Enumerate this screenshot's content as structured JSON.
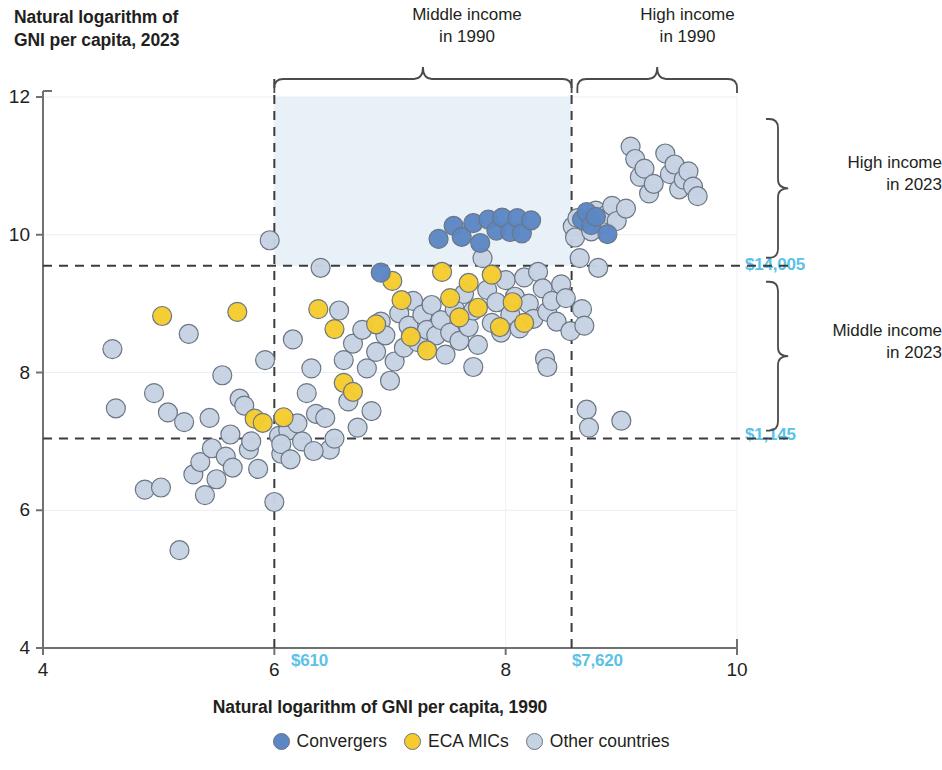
{
  "chart_data": {
    "type": "scatter",
    "title": "",
    "ylabel": "Natural logarithm of\nGNI per capita, 2023",
    "xlabel": "Natural logarithm of GNI per capita, 1990",
    "xlim": [
      4,
      10
    ],
    "ylim": [
      4,
      12
    ],
    "xticks": [
      "4",
      "6",
      "8",
      "10"
    ],
    "xtick_values": [
      4,
      6,
      8,
      10
    ],
    "yticks": [
      "4",
      "6",
      "8",
      "10",
      "12"
    ],
    "ytick_values": [
      4,
      6,
      8,
      10,
      12
    ],
    "grid": true,
    "legend_position": "bottom",
    "legend": [
      {
        "name": "Convergers",
        "color": "#5b87c4"
      },
      {
        "name": "ECA MICs",
        "color": "#f5cb2e"
      },
      {
        "name": "Other countries",
        "color": "#c6d3e3"
      }
    ],
    "threshold_lines": {
      "horizontal": [
        {
          "label": "$14,005",
          "value": 9.55,
          "color": "#5bc2e7",
          "style": "dashed"
        },
        {
          "label": "$1,145",
          "value": 7.04,
          "color": "#5bc2e7",
          "style": "dashed"
        }
      ],
      "vertical": [
        {
          "label": "$610",
          "value": 6.0,
          "color": "#5bc2e7",
          "style": "dashed"
        },
        {
          "label": "$7,620",
          "value": 8.57,
          "color": "#5bc2e7",
          "style": "dashed"
        }
      ]
    },
    "shaded_region": {
      "x_range": [
        6.0,
        8.57
      ],
      "y_range": [
        9.55,
        12
      ],
      "color": "#e8f1f7"
    },
    "annotations": [
      {
        "text": "Middle income\nin 1990",
        "position": "top",
        "span": [
          6.0,
          8.57
        ]
      },
      {
        "text": "High income\nin 1990",
        "position": "top",
        "span": [
          8.57,
          10
        ]
      },
      {
        "text": "High income\nin 2023",
        "position": "right",
        "span": [
          9.55,
          12
        ]
      },
      {
        "text": "Middle income\nin 2023",
        "position": "right",
        "span": [
          7.04,
          9.55
        ]
      }
    ],
    "series": [
      {
        "name": "Convergers",
        "color": "#5b87c4",
        "points": [
          [
            6.92,
            9.45
          ],
          [
            7.42,
            9.94
          ],
          [
            7.55,
            10.13
          ],
          [
            7.62,
            9.97
          ],
          [
            7.72,
            10.17
          ],
          [
            7.78,
            9.88
          ],
          [
            7.85,
            10.22
          ],
          [
            7.92,
            10.06
          ],
          [
            7.97,
            10.25
          ],
          [
            8.04,
            10.04
          ],
          [
            8.1,
            10.24
          ],
          [
            8.14,
            10.02
          ],
          [
            8.22,
            10.21
          ],
          [
            8.66,
            10.22
          ],
          [
            8.7,
            10.33
          ],
          [
            8.74,
            10.14
          ],
          [
            8.78,
            10.26
          ],
          [
            8.88,
            10.01
          ]
        ]
      },
      {
        "name": "ECA MICs",
        "color": "#f5cb2e",
        "points": [
          [
            5.03,
            8.82
          ],
          [
            5.68,
            8.88
          ],
          [
            5.83,
            7.33
          ],
          [
            5.9,
            7.27
          ],
          [
            6.38,
            8.92
          ],
          [
            6.52,
            8.63
          ],
          [
            6.6,
            7.85
          ],
          [
            6.68,
            7.72
          ],
          [
            6.88,
            8.7
          ],
          [
            7.02,
            9.33
          ],
          [
            7.1,
            9.05
          ],
          [
            7.18,
            8.52
          ],
          [
            7.32,
            8.32
          ],
          [
            7.45,
            9.46
          ],
          [
            7.52,
            9.08
          ],
          [
            7.6,
            8.8
          ],
          [
            7.68,
            9.3
          ],
          [
            7.76,
            8.94
          ],
          [
            7.88,
            9.42
          ],
          [
            7.95,
            8.66
          ],
          [
            8.06,
            9.02
          ],
          [
            8.16,
            8.72
          ],
          [
            6.08,
            7.35
          ]
        ]
      },
      {
        "name": "Other countries",
        "color": "#c6d3e3",
        "points": [
          [
            4.6,
            8.34
          ],
          [
            4.63,
            7.48
          ],
          [
            4.88,
            6.3
          ],
          [
            4.96,
            7.7
          ],
          [
            5.02,
            6.33
          ],
          [
            5.08,
            7.42
          ],
          [
            5.18,
            5.42
          ],
          [
            5.26,
            8.56
          ],
          [
            5.3,
            6.52
          ],
          [
            5.36,
            6.7
          ],
          [
            5.4,
            6.22
          ],
          [
            5.46,
            6.9
          ],
          [
            5.5,
            6.45
          ],
          [
            5.55,
            7.96
          ],
          [
            5.58,
            6.78
          ],
          [
            5.62,
            7.1
          ],
          [
            5.64,
            6.62
          ],
          [
            5.7,
            7.62
          ],
          [
            5.74,
            7.52
          ],
          [
            5.78,
            6.88
          ],
          [
            5.8,
            7.0
          ],
          [
            5.86,
            6.6
          ],
          [
            5.92,
            8.18
          ],
          [
            5.96,
            9.92
          ],
          [
            6.0,
            6.12
          ],
          [
            6.04,
            7.08
          ],
          [
            6.06,
            6.82
          ],
          [
            6.12,
            7.16
          ],
          [
            6.16,
            8.48
          ],
          [
            6.2,
            7.26
          ],
          [
            6.24,
            7.0
          ],
          [
            6.28,
            7.7
          ],
          [
            6.32,
            8.06
          ],
          [
            6.36,
            7.4
          ],
          [
            6.4,
            9.52
          ],
          [
            6.44,
            7.34
          ],
          [
            6.48,
            6.88
          ],
          [
            6.52,
            7.04
          ],
          [
            6.56,
            8.9
          ],
          [
            6.6,
            8.18
          ],
          [
            6.64,
            7.58
          ],
          [
            6.68,
            8.42
          ],
          [
            6.72,
            7.2
          ],
          [
            6.76,
            8.62
          ],
          [
            6.8,
            8.06
          ],
          [
            6.84,
            7.44
          ],
          [
            6.88,
            8.3
          ],
          [
            6.92,
            8.74
          ],
          [
            6.96,
            8.54
          ],
          [
            7.0,
            7.88
          ],
          [
            7.04,
            8.16
          ],
          [
            7.08,
            8.86
          ],
          [
            7.12,
            8.36
          ],
          [
            7.16,
            8.68
          ],
          [
            7.2,
            9.04
          ],
          [
            7.24,
            8.44
          ],
          [
            7.28,
            8.84
          ],
          [
            7.32,
            8.62
          ],
          [
            7.36,
            8.98
          ],
          [
            7.4,
            8.54
          ],
          [
            7.44,
            8.76
          ],
          [
            7.48,
            8.26
          ],
          [
            7.52,
            8.58
          ],
          [
            7.56,
            8.92
          ],
          [
            7.6,
            8.46
          ],
          [
            7.64,
            9.14
          ],
          [
            7.68,
            8.66
          ],
          [
            7.72,
            8.9
          ],
          [
            7.76,
            8.4
          ],
          [
            7.8,
            9.66
          ],
          [
            7.84,
            9.2
          ],
          [
            7.88,
            8.72
          ],
          [
            7.92,
            9.02
          ],
          [
            7.96,
            8.58
          ],
          [
            8.0,
            9.34
          ],
          [
            8.04,
            8.84
          ],
          [
            8.08,
            9.1
          ],
          [
            8.12,
            8.64
          ],
          [
            8.16,
            9.38
          ],
          [
            8.2,
            9.0
          ],
          [
            8.24,
            8.78
          ],
          [
            8.28,
            9.46
          ],
          [
            8.32,
            9.22
          ],
          [
            8.36,
            8.88
          ],
          [
            8.4,
            9.04
          ],
          [
            8.44,
            8.74
          ],
          [
            8.48,
            9.28
          ],
          [
            8.52,
            9.08
          ],
          [
            8.56,
            8.6
          ],
          [
            8.58,
            10.12
          ],
          [
            8.6,
            9.96
          ],
          [
            8.62,
            10.24
          ],
          [
            8.64,
            9.66
          ],
          [
            8.66,
            8.92
          ],
          [
            8.68,
            8.68
          ],
          [
            8.7,
            7.46
          ],
          [
            8.72,
            7.2
          ],
          [
            8.74,
            10.05
          ],
          [
            8.78,
            10.35
          ],
          [
            8.8,
            9.52
          ],
          [
            8.84,
            10.16
          ],
          [
            8.88,
            10.3
          ],
          [
            8.92,
            10.42
          ],
          [
            8.96,
            10.2
          ],
          [
            9.0,
            7.3
          ],
          [
            9.04,
            10.38
          ],
          [
            9.08,
            11.28
          ],
          [
            9.12,
            11.1
          ],
          [
            9.16,
            10.84
          ],
          [
            9.2,
            10.96
          ],
          [
            9.24,
            10.6
          ],
          [
            9.28,
            10.74
          ],
          [
            9.38,
            11.18
          ],
          [
            9.42,
            10.88
          ],
          [
            9.46,
            11.02
          ],
          [
            9.5,
            10.66
          ],
          [
            9.54,
            10.8
          ],
          [
            9.58,
            10.92
          ],
          [
            9.62,
            10.7
          ],
          [
            9.66,
            10.56
          ],
          [
            5.22,
            7.28
          ],
          [
            6.06,
            6.96
          ],
          [
            6.14,
            6.74
          ],
          [
            5.44,
            7.34
          ],
          [
            8.34,
            8.2
          ],
          [
            8.36,
            8.08
          ],
          [
            7.72,
            8.08
          ],
          [
            6.34,
            6.86
          ]
        ]
      }
    ]
  }
}
